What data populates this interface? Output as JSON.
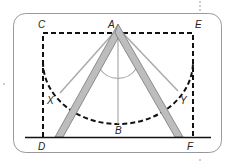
{
  "diagram": {
    "labels": {
      "A": "A",
      "B": "B",
      "C": "C",
      "D": "D",
      "E": "E",
      "F": "F",
      "X": "X",
      "Y": "Y"
    },
    "colors": {
      "frame_border": "#888888",
      "dashed_lines": "#111111",
      "legs_fill": "#bdbdbd",
      "legs_stroke": "#777777",
      "swing_lines": "#aaaaaa",
      "ground": "#111111",
      "label_text": "#222222"
    }
  }
}
